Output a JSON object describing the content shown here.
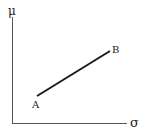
{
  "diagram": {
    "y_axis_label": "μ",
    "x_axis_label": "σ",
    "points": [
      {
        "label": "A"
      },
      {
        "label": "B"
      }
    ],
    "colors": {
      "axis": "#444444",
      "line": "#1a1a1a",
      "text": "#222222"
    }
  }
}
